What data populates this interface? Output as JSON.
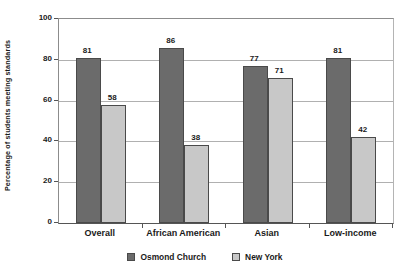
{
  "chart_data": {
    "type": "bar",
    "title": "",
    "subtitle": "",
    "xlabel": "",
    "ylabel": "Percentage of students meeting standards",
    "categories": [
      "Overall",
      "African American",
      "Asian",
      "Low-income"
    ],
    "series": [
      {
        "name": "Osmond Church",
        "color": "#6b6b6b",
        "values": [
          81,
          86,
          77,
          81
        ]
      },
      {
        "name": "New York",
        "color": "#c8c8c8",
        "values": [
          58,
          38,
          71,
          42
        ]
      }
    ],
    "ylim": [
      0,
      100
    ],
    "yticks": [
      0,
      20,
      40,
      60,
      80,
      100
    ],
    "ytick_labels": [
      "0",
      "20",
      "40",
      "60",
      "80",
      "100"
    ],
    "grid": true,
    "grid_axis": "y",
    "legend_position": "bottom",
    "data_labels": true,
    "data_label_values": [
      [
        "81",
        "58"
      ],
      [
        "86",
        "38"
      ],
      [
        "77",
        "71"
      ],
      [
        "81",
        "42"
      ]
    ],
    "bar_group_order": "series-adjacent",
    "background_color": "#ffffff",
    "axis_color": "#555555",
    "gridline_color": "#b0b0b0"
  },
  "legend": {
    "items": [
      {
        "label": "Osmond Church",
        "swatch": "legend-swatch-osmond-church"
      },
      {
        "label": "New York",
        "swatch": "legend-swatch-new-york"
      }
    ]
  }
}
